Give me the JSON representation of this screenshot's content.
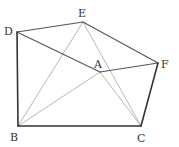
{
  "diagram": {
    "type": "geometry-figure",
    "points": {
      "A": {
        "label": "A",
        "x": 100,
        "y": 72,
        "label_x": 94,
        "label_y": 68
      },
      "B": {
        "label": "B",
        "x": 18,
        "y": 126,
        "label_x": 9,
        "label_y": 140
      },
      "C": {
        "label": "C",
        "x": 141,
        "y": 126,
        "label_x": 137,
        "label_y": 141
      },
      "D": {
        "label": "D",
        "x": 17,
        "y": 32,
        "label_x": 4,
        "label_y": 33
      },
      "E": {
        "label": "E",
        "x": 83,
        "y": 22,
        "label_x": 78,
        "label_y": 17
      },
      "F": {
        "label": "F",
        "x": 158,
        "y": 63,
        "label_x": 161,
        "label_y": 67
      }
    },
    "segments": [
      {
        "from": "D",
        "to": "B",
        "style": "thick"
      },
      {
        "from": "B",
        "to": "C",
        "style": "thick"
      },
      {
        "from": "C",
        "to": "F",
        "style": "thick"
      },
      {
        "from": "D",
        "to": "E",
        "style": "medium"
      },
      {
        "from": "E",
        "to": "F",
        "style": "medium"
      },
      {
        "from": "D",
        "to": "A",
        "style": "medium"
      },
      {
        "from": "A",
        "to": "F",
        "style": "medium"
      },
      {
        "from": "E",
        "to": "B",
        "style": "thin"
      },
      {
        "from": "A",
        "to": "B",
        "style": "thin"
      },
      {
        "from": "E",
        "to": "C",
        "style": "thin"
      },
      {
        "from": "A",
        "to": "C",
        "style": "thin"
      }
    ]
  },
  "labels": {
    "A": "A",
    "B": "B",
    "C": "C",
    "D": "D",
    "E": "E",
    "F": "F"
  }
}
